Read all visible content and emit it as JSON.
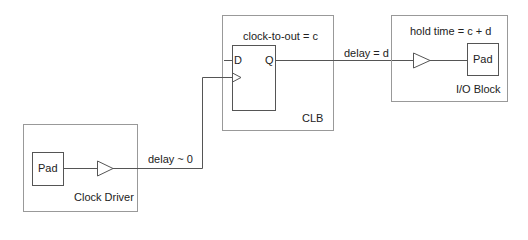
{
  "diagram": {
    "clb": {
      "title": "clock-to-out = c",
      "name": "CLB",
      "flipflop": {
        "d_label": "D",
        "q_label": "Q"
      }
    },
    "io_block": {
      "title": "hold time = c + d",
      "name": "I/O Block",
      "pad_label": "Pad"
    },
    "clock_driver": {
      "name": "Clock Driver",
      "pad_label": "Pad"
    },
    "wires": {
      "q_to_io_label": "delay = d",
      "clock_label": "delay ~ 0"
    },
    "colors": {
      "line": "#555555",
      "box": "#999999",
      "text": "#222222"
    }
  }
}
